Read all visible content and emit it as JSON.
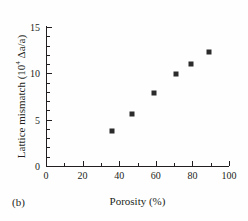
{
  "chart_data": {
    "type": "scatter",
    "title": "",
    "panel_label": "(b)",
    "xlabel": "Porosity (%)",
    "ylabel_text": "Lattice mismatch (10",
    "ylabel_sup": "4",
    "ylabel_tail": " Δa/a)",
    "xlim": [
      0,
      100
    ],
    "ylim": [
      0,
      15
    ],
    "grid": false,
    "legend": null,
    "xticks": [
      0,
      20,
      40,
      60,
      80,
      100
    ],
    "xticklabels": [
      "0",
      "20",
      "40",
      "60",
      "80",
      "100"
    ],
    "xminorticks": [
      10,
      30,
      50,
      70,
      90
    ],
    "yticks": [
      0,
      5,
      10,
      15
    ],
    "yticklabels": [
      "0",
      "5",
      "10",
      "15"
    ],
    "yminorticks": [
      1,
      2,
      3,
      4,
      6,
      7,
      8,
      9,
      11,
      12,
      13,
      14
    ],
    "marker": "filled-square",
    "marker_color": "#2b2b2b",
    "x": [
      36,
      47,
      59,
      71,
      79,
      89
    ],
    "y": [
      3.8,
      5.6,
      7.9,
      9.9,
      11.0,
      12.3
    ],
    "points": [
      {
        "x": 36,
        "y": 3.8
      },
      {
        "x": 47,
        "y": 5.6
      },
      {
        "x": 59,
        "y": 7.9
      },
      {
        "x": 71,
        "y": 9.9
      },
      {
        "x": 79,
        "y": 11.0
      },
      {
        "x": 89,
        "y": 12.3
      }
    ]
  }
}
